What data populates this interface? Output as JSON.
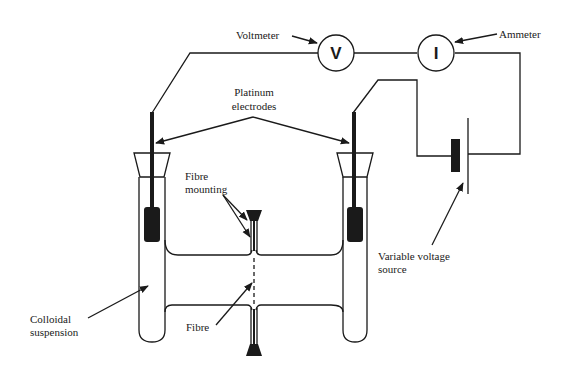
{
  "diagram": {
    "type": "electrophoresis apparatus schematic",
    "colors": {
      "ink": "#1a1a1a",
      "background": "#ffffff"
    },
    "meters": {
      "voltmeter": {
        "symbol": "V",
        "label": "Voltmeter"
      },
      "ammeter": {
        "symbol": "I",
        "label": "Ammeter"
      }
    },
    "labels": {
      "electrodes_line1": "Platinum",
      "electrodes_line2": "electrodes",
      "mounting_line1": "Fibre",
      "mounting_line2": "mounting",
      "source_line1": "Variable voltage",
      "source_line2": "source",
      "suspension_line1": "Colloidal",
      "suspension_line2": "suspension",
      "fibre": "Fibre"
    }
  }
}
